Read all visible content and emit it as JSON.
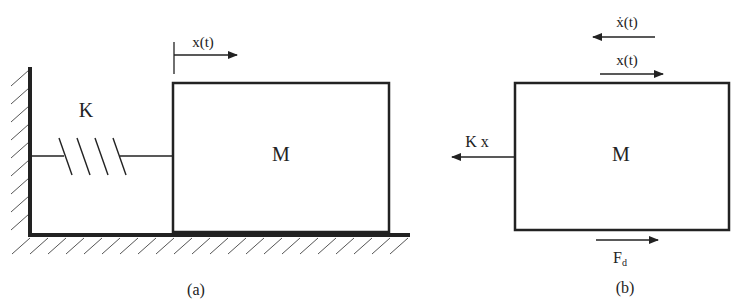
{
  "figure_a": {
    "caption": "(a)",
    "spring_label": "K",
    "mass_label": "M",
    "displacement_label": "x(t)"
  },
  "figure_b": {
    "caption": "(b)",
    "mass_label": "M",
    "velocity_label": "ẋ(t)",
    "displacement_label": "x(t)",
    "spring_force_label": "K x",
    "damping_force_label": "F",
    "damping_force_subscript": "d"
  },
  "colors": {
    "stroke": "#222222",
    "background": "#ffffff"
  }
}
